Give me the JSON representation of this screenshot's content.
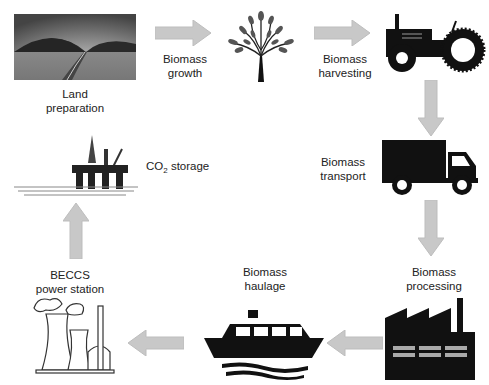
{
  "colors": {
    "arrow": "#c8c8c8",
    "icon": "#111111",
    "text": "#222222"
  },
  "steps": [
    {
      "id": "land",
      "icon": "landscape-icon",
      "line1": "Land",
      "line2": "preparation"
    },
    {
      "id": "growth",
      "icon": "tree-icon",
      "line1": "Biomass",
      "line2": "growth"
    },
    {
      "id": "harvesting",
      "icon": "tractor-icon",
      "line1": "Biomass",
      "line2": "harvesting"
    },
    {
      "id": "transport",
      "icon": "truck-icon",
      "line1": "Biomass",
      "line2": "transport"
    },
    {
      "id": "processing",
      "icon": "factory-icon",
      "line1": "Biomass",
      "line2": "processing"
    },
    {
      "id": "haulage",
      "icon": "ship-icon",
      "line1": "Biomass",
      "line2": "haulage"
    },
    {
      "id": "power",
      "icon": "power-station-icon",
      "line1": "BECCS",
      "line2": "power station"
    },
    {
      "id": "storage",
      "icon": "oil-platform-icon",
      "co": "CO",
      "sub": "2",
      "rest": " storage"
    }
  ]
}
